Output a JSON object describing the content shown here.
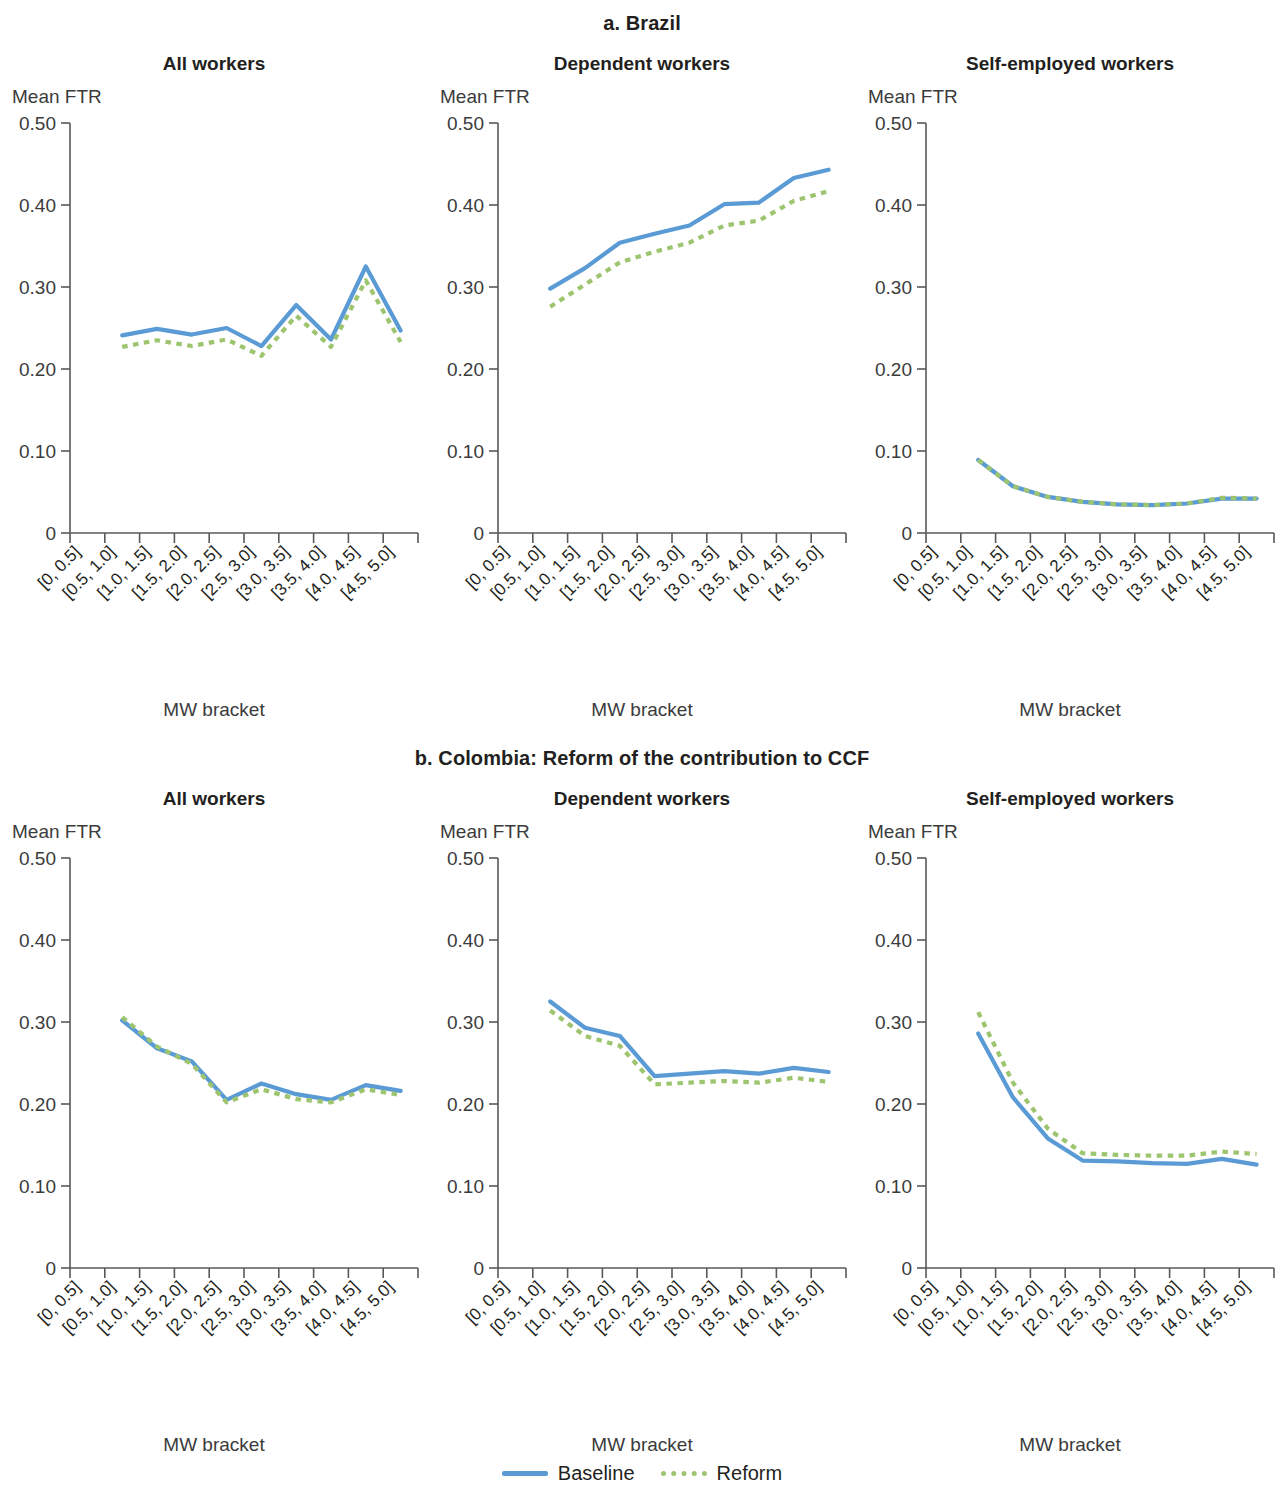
{
  "figure": {
    "sections": [
      {
        "id": "a",
        "title": "a. Brazil"
      },
      {
        "id": "b",
        "title": "b. Colombia: Reform of the contribution to CCF"
      }
    ],
    "panel_titles": [
      "All workers",
      "Dependent workers",
      "Self-employed workers"
    ],
    "y_axis_caption": "Mean FTR",
    "x_axis_title": "MW bracket",
    "y_ticks": [
      "0.50",
      "0.40",
      "0.30",
      "0.20",
      "0.10",
      "0"
    ],
    "y_tick_values": [
      0.5,
      0.4,
      0.3,
      0.2,
      0.1,
      0
    ],
    "x_tick_labels": [
      "[0, 0.5]",
      "[0.5, 1.0]",
      "[1.0, 1.5]",
      "[1.5, 2.0]",
      "[2.0, 2.5]",
      "[2.5, 3.0]",
      "[3.0, 3.5]",
      "[3.5, 4.0]",
      "[4.0, 4.5]",
      "[4.5, 5.0]"
    ],
    "legend": [
      {
        "label": "Baseline",
        "style": "solid",
        "color": "#5b9bd5"
      },
      {
        "label": "Reform",
        "style": "dotted",
        "color": "#9dc46e"
      }
    ],
    "colors": {
      "baseline": "#5b9bd5",
      "reform": "#9dc46e",
      "axis": "#58595b",
      "text": "#231f20"
    }
  },
  "chart_data": [
    {
      "id": "brazil-all-workers",
      "type": "line",
      "title": "All workers",
      "section": "a. Brazil",
      "xlabel": "MW bracket",
      "ylabel": "Mean FTR",
      "ylim": [
        0,
        0.5
      ],
      "grid": false,
      "legend_position": "bottom",
      "categories": [
        "[0, 0.5]",
        "[0.5, 1.0]",
        "[1.0, 1.5]",
        "[1.5, 2.0]",
        "[2.0, 2.5]",
        "[2.5, 3.0]",
        "[3.0, 3.5]",
        "[3.5, 4.0]",
        "[4.0, 4.5]",
        "[4.5, 5.0]"
      ],
      "series": [
        {
          "name": "Baseline",
          "values": [
            null,
            0.241,
            0.249,
            0.242,
            0.25,
            0.228,
            0.278,
            0.236,
            0.325,
            0.247
          ]
        },
        {
          "name": "Reform",
          "values": [
            null,
            0.227,
            0.235,
            0.228,
            0.236,
            0.216,
            0.265,
            0.227,
            0.308,
            0.233
          ]
        }
      ]
    },
    {
      "id": "brazil-dependent-workers",
      "type": "line",
      "title": "Dependent workers",
      "section": "a. Brazil",
      "xlabel": "MW bracket",
      "ylabel": "Mean FTR",
      "ylim": [
        0,
        0.5
      ],
      "grid": false,
      "legend_position": "bottom",
      "categories": [
        "[0, 0.5]",
        "[0.5, 1.0]",
        "[1.0, 1.5]",
        "[1.5, 2.0]",
        "[2.0, 2.5]",
        "[2.5, 3.0]",
        "[3.0, 3.5]",
        "[3.5, 4.0]",
        "[4.0, 4.5]",
        "[4.5, 5.0]"
      ],
      "series": [
        {
          "name": "Baseline",
          "values": [
            null,
            0.298,
            0.323,
            0.354,
            0.365,
            0.375,
            0.401,
            0.403,
            0.433,
            0.443
          ]
        },
        {
          "name": "Reform",
          "values": [
            null,
            0.276,
            0.303,
            0.33,
            0.343,
            0.354,
            0.375,
            0.381,
            0.405,
            0.417
          ]
        }
      ]
    },
    {
      "id": "brazil-self-employed-workers",
      "type": "line",
      "title": "Self-employed workers",
      "section": "a. Brazil",
      "xlabel": "MW bracket",
      "ylabel": "Mean FTR",
      "ylim": [
        0,
        0.5
      ],
      "grid": false,
      "legend_position": "bottom",
      "categories": [
        "[0, 0.5]",
        "[0.5, 1.0]",
        "[1.0, 1.5]",
        "[1.5, 2.0]",
        "[2.0, 2.5]",
        "[2.5, 3.0]",
        "[3.0, 3.5]",
        "[3.5, 4.0]",
        "[4.0, 4.5]",
        "[4.5, 5.0]"
      ],
      "series": [
        {
          "name": "Baseline",
          "values": [
            null,
            0.089,
            0.057,
            0.044,
            0.038,
            0.035,
            0.034,
            0.036,
            0.042,
            0.042
          ]
        },
        {
          "name": "Reform",
          "values": [
            null,
            0.089,
            0.057,
            0.044,
            0.038,
            0.035,
            0.034,
            0.036,
            0.043,
            0.042
          ]
        }
      ]
    },
    {
      "id": "colombia-all-workers",
      "type": "line",
      "title": "All workers",
      "section": "b. Colombia: Reform of the contribution to CCF",
      "xlabel": "MW bracket",
      "ylabel": "Mean FTR",
      "ylim": [
        0,
        0.5
      ],
      "grid": false,
      "legend_position": "bottom",
      "categories": [
        "[0, 0.5]",
        "[0.5, 1.0]",
        "[1.0, 1.5]",
        "[1.5, 2.0]",
        "[2.0, 2.5]",
        "[2.5, 3.0]",
        "[3.0, 3.5]",
        "[3.5, 4.0]",
        "[4.0, 4.5]",
        "[4.5, 5.0]"
      ],
      "series": [
        {
          "name": "Baseline",
          "values": [
            null,
            0.302,
            0.268,
            0.252,
            0.205,
            0.225,
            0.212,
            0.205,
            0.223,
            0.216
          ]
        },
        {
          "name": "Reform",
          "values": [
            null,
            0.306,
            0.27,
            0.249,
            0.202,
            0.218,
            0.206,
            0.202,
            0.218,
            0.211
          ]
        }
      ]
    },
    {
      "id": "colombia-dependent-workers",
      "type": "line",
      "title": "Dependent workers",
      "section": "b. Colombia: Reform of the contribution to CCF",
      "xlabel": "MW bracket",
      "ylabel": "Mean FTR",
      "ylim": [
        0,
        0.5
      ],
      "grid": false,
      "legend_position": "bottom",
      "categories": [
        "[0, 0.5]",
        "[0.5, 1.0]",
        "[1.0, 1.5]",
        "[1.5, 2.0]",
        "[2.0, 2.5]",
        "[2.5, 3.0]",
        "[3.0, 3.5]",
        "[3.5, 4.0]",
        "[4.0, 4.5]",
        "[4.5, 5.0]"
      ],
      "series": [
        {
          "name": "Baseline",
          "values": [
            null,
            0.325,
            0.293,
            0.283,
            0.234,
            0.237,
            0.24,
            0.237,
            0.244,
            0.239
          ]
        },
        {
          "name": "Reform",
          "values": [
            null,
            0.314,
            0.283,
            0.271,
            0.224,
            0.226,
            0.228,
            0.226,
            0.232,
            0.227
          ]
        }
      ]
    },
    {
      "id": "colombia-self-employed-workers",
      "type": "line",
      "title": "Self-employed workers",
      "section": "b. Colombia: Reform of the contribution to CCF",
      "xlabel": "MW bracket",
      "ylabel": "Mean FTR",
      "ylim": [
        0,
        0.5
      ],
      "grid": false,
      "legend_position": "bottom",
      "categories": [
        "[0, 0.5]",
        "[0.5, 1.0]",
        "[1.0, 1.5]",
        "[1.5, 2.0]",
        "[2.0, 2.5]",
        "[2.5, 3.0]",
        "[3.0, 3.5]",
        "[3.5, 4.0]",
        "[4.0, 4.5]",
        "[4.5, 5.0]"
      ],
      "series": [
        {
          "name": "Baseline",
          "values": [
            null,
            0.286,
            0.208,
            0.158,
            0.131,
            0.13,
            0.128,
            0.127,
            0.133,
            0.126
          ]
        },
        {
          "name": "Reform",
          "values": [
            null,
            0.312,
            0.226,
            0.17,
            0.14,
            0.138,
            0.137,
            0.137,
            0.142,
            0.139
          ]
        }
      ]
    }
  ]
}
